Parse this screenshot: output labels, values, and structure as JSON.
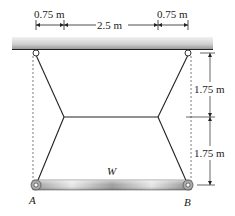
{
  "figure": {
    "dimensions": {
      "left_offset": "0.75 m",
      "middle_span": "2.5 m",
      "right_offset": "0.75 m",
      "upper_height": "1.75 m",
      "lower_height": "1.75 m"
    },
    "labels": {
      "load": "W",
      "left_end": "A",
      "right_end": "B"
    },
    "colors": {
      "line": "#222222",
      "ceiling_light": "#e6e6e6",
      "ceiling_dark": "#9a9a9a",
      "beam_light": "#e8e8e8",
      "beam_dark": "#8c8c8c"
    }
  }
}
